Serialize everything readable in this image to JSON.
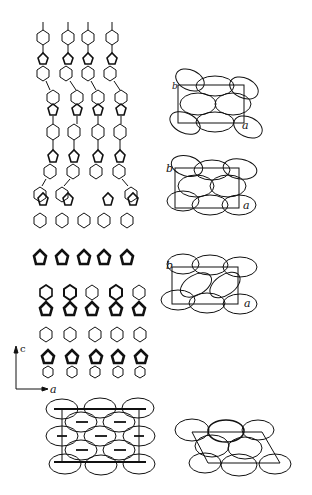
{
  "figure": {
    "type": "crystal packing diagram",
    "main_projection": {
      "axes": {
        "vertical": "c",
        "horizontal": "a"
      },
      "columns": 5,
      "description": "stacked molecular chains of phenyl and fused five-membered ring units along c"
    },
    "unit_cell_panels": [
      {
        "id": "panel-1",
        "axis_labels": {
          "up": "b",
          "right": "a"
        }
      },
      {
        "id": "panel-2",
        "axis_labels": {
          "up": "b",
          "right": "a"
        }
      },
      {
        "id": "panel-3",
        "axis_labels": {
          "up": "b",
          "right": "a"
        }
      },
      {
        "id": "panel-4",
        "axis_labels": {}
      },
      {
        "id": "panel-5",
        "axis_labels": {}
      }
    ],
    "stroke_color": "#111111",
    "background": "#ffffff"
  }
}
